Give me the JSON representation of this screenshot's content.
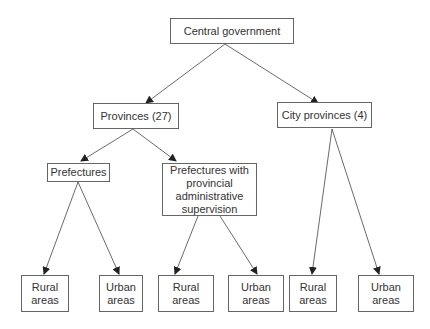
{
  "diagram": {
    "nodes": [
      {
        "id": "central",
        "label": "Central government"
      },
      {
        "id": "provinces",
        "label": "Provinces (27)"
      },
      {
        "id": "city_provinces",
        "label": "City provinces (4)"
      },
      {
        "id": "prefectures",
        "label": "Prefectures"
      },
      {
        "id": "pref_supervision",
        "label": "Prefectures with\nprovincial\nadministrative\nsupervision"
      },
      {
        "id": "rural1",
        "label": "Rural\nareas"
      },
      {
        "id": "urban1",
        "label": "Urban\nareas"
      },
      {
        "id": "rural2",
        "label": "Rural\nareas"
      },
      {
        "id": "urban2",
        "label": "Urban\nareas"
      },
      {
        "id": "rural3",
        "label": "Rural\nareas"
      },
      {
        "id": "urban3",
        "label": "Urban\nareas"
      }
    ],
    "edges": [
      [
        "central",
        "provinces"
      ],
      [
        "central",
        "city_provinces"
      ],
      [
        "provinces",
        "prefectures"
      ],
      [
        "provinces",
        "pref_supervision"
      ],
      [
        "prefectures",
        "rural1"
      ],
      [
        "prefectures",
        "urban1"
      ],
      [
        "pref_supervision",
        "rural2"
      ],
      [
        "pref_supervision",
        "urban2"
      ],
      [
        "city_provinces",
        "rural3"
      ],
      [
        "city_provinces",
        "urban3"
      ]
    ]
  }
}
